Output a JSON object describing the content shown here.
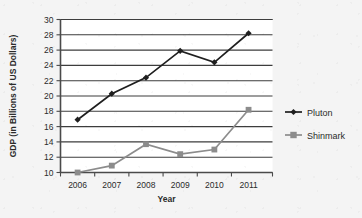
{
  "chart_data": {
    "type": "line",
    "title": "",
    "xlabel": "Year",
    "ylabel": "GDP (in Billions of US Dollars)",
    "categories": [
      "2006",
      "2007",
      "2008",
      "2009",
      "2010",
      "2011"
    ],
    "x": [
      2006,
      2007,
      2008,
      2009,
      2010,
      2011
    ],
    "xlim": [
      2005.5,
      2011.7
    ],
    "ylim": [
      10,
      30
    ],
    "ytick_step": 2,
    "yticks": [
      "10",
      "12",
      "14",
      "16",
      "18",
      "20",
      "22",
      "24",
      "26",
      "28",
      "30"
    ],
    "grid": true,
    "legend_position": "right",
    "series": [
      {
        "name": "Pluton",
        "color": "#1f1f1f",
        "marker": "diamond",
        "values": [
          16.9,
          20.3,
          22.4,
          25.9,
          24.4,
          28.2
        ]
      },
      {
        "name": "Shinmark",
        "color": "#8c8c8c",
        "marker": "square",
        "values": [
          10.0,
          10.9,
          13.7,
          12.4,
          13.0,
          18.2
        ]
      }
    ]
  },
  "legend": {
    "entries": [
      {
        "label": "Pluton"
      },
      {
        "label": "Shinmark"
      }
    ]
  },
  "axes": {
    "x_title": "Year",
    "y_title": "GDP (in Billions of US Dollars)"
  },
  "colors": {
    "background": "#f4f4f4",
    "plot_background": "#ffffff",
    "axis": "#4a4a4a",
    "grid": "#3d3d3d",
    "series_pluton": "#1f1f1f",
    "series_shinmark": "#8c8c8c"
  }
}
